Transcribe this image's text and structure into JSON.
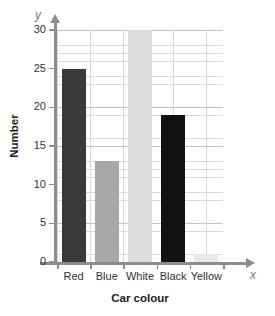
{
  "chart_data": {
    "type": "bar",
    "title": "",
    "xlabel": "Car colour",
    "ylabel": "Number",
    "categories": [
      "Red",
      "Blue",
      "White",
      "Black",
      "Yellow"
    ],
    "values": [
      25,
      13,
      30,
      19,
      1
    ],
    "bar_colors": [
      "#3a3a3a",
      "#a8a8a8",
      "#dcdcdc",
      "#111111",
      "#e8e8e8"
    ],
    "ylim": [
      0,
      30
    ],
    "ytick_values": [
      0,
      5,
      10,
      15,
      20,
      25,
      30
    ],
    "ytick_labels": [
      "0",
      "5",
      "10",
      "15",
      "20",
      "25",
      "30"
    ],
    "ytick_step_major": 5,
    "ytick_step_minor": 1,
    "grid": true,
    "legend": "none",
    "axis_letters": {
      "y": "y",
      "x": "x"
    }
  }
}
